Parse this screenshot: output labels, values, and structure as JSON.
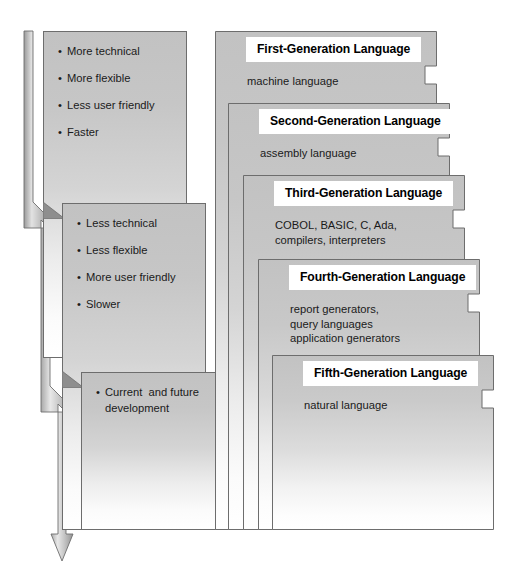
{
  "diagram": {
    "colors": {
      "panel_top": "#c2c2c2",
      "panel_bottom": "#ffffff",
      "panel_border": "#6d6d6d",
      "title_bg": "#ffffff",
      "text": "#1a1a1a",
      "arrow_fill": "#b9b9b9",
      "arrow_stroke": "#6d6d6d"
    }
  },
  "attribute_panels": [
    {
      "id": "high-level-traits",
      "items": [
        "More technical",
        "More flexible",
        "Less user friendly",
        "Faster"
      ]
    },
    {
      "id": "low-level-traits",
      "items": [
        "Less technical",
        "Less flexible",
        "More user friendly",
        "Slower"
      ]
    },
    {
      "id": "future-traits",
      "items": [
        "Current  and future"
      ],
      "items_continued": [
        "development"
      ]
    }
  ],
  "generation_panels": [
    {
      "id": "gen-1",
      "title": "First-Generation Language",
      "body": "machine language"
    },
    {
      "id": "gen-2",
      "title": "Second-Generation Language",
      "body": "assembly language"
    },
    {
      "id": "gen-3",
      "title": "Third-Generation Language",
      "body": "COBOL, BASIC, C, Ada,\ncompilers, interpreters"
    },
    {
      "id": "gen-4",
      "title": "Fourth-Generation Language",
      "body": "report generators,\nquery languages\napplication generators"
    },
    {
      "id": "gen-5",
      "title": "Fifth-Generation Language",
      "body": "natural language"
    }
  ],
  "arrow": {
    "name": "progression-arrow",
    "direction": "downward"
  }
}
